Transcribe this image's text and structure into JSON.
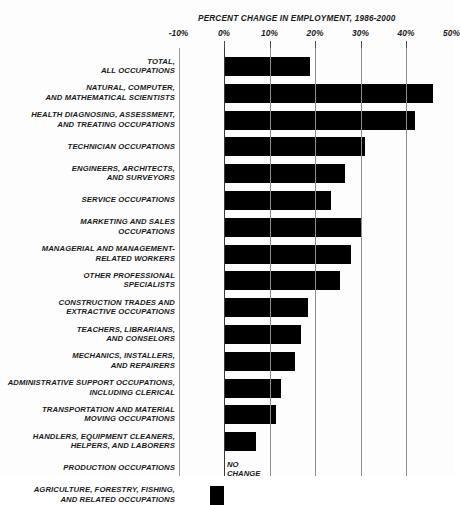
{
  "chart_data": {
    "type": "bar",
    "orientation": "horizontal",
    "title": "PERCENT CHANGE IN EMPLOYMENT, 1986-2000",
    "xlabel": "",
    "ylabel": "",
    "xlim": [
      -10,
      50
    ],
    "grid": true,
    "legend": null,
    "tick_labels": [
      "-10%",
      "0%",
      "10%",
      "20%",
      "30%",
      "40%",
      "50%"
    ],
    "tick_values": [
      -10,
      0,
      10,
      20,
      30,
      40,
      50
    ],
    "annotations": [
      {
        "text": "NO\nCHANGE",
        "category": "PRODUCTION OCCUPATIONS",
        "value": 0
      }
    ],
    "categories": [
      "TOTAL,\nALL OCCUPATIONS",
      "NATURAL, COMPUTER,\nAND MATHEMATICAL SCIENTISTS",
      "HEALTH DIAGNOSING, ASSESSMENT,\nAND TREATING OCCUPATIONS",
      "TECHNICIAN OCCUPATIONS",
      "ENGINEERS, ARCHITECTS,\nAND SURVEYORS",
      "SERVICE OCCUPATIONS",
      "MARKETING AND SALES\nOCCUPATIONS",
      "MANAGERIAL AND MANAGEMENT-\nRELATED WORKERS",
      "OTHER PROFESSIONAL\nSPECIALISTS",
      "CONSTRUCTION TRADES AND\nEXTRACTIVE OCCUPATIONS",
      "TEACHERS, LIBRARIANS,\nAND CONSELORS",
      "MECHANICS, INSTALLERS,\nAND REPAIRERS",
      "ADMINISTRATIVE SUPPORT OCCUPATIONS,\nINCLUDING CLERICAL",
      "TRANSPORTATION AND MATERIAL\nMOVING OCCUPATIONS",
      "HANDLERS, EQUIPMENT CLEANERS,\nHELPERS, AND LABORERS",
      "PRODUCTION OCCUPATIONS",
      "AGRICULTURE, FORESTRY, FISHING,\nAND RELATED OCCUPATIONS"
    ],
    "values": [
      19,
      46,
      42,
      31,
      26.5,
      23.5,
      30,
      28,
      25.5,
      18.5,
      17,
      15.5,
      12.5,
      11.5,
      7,
      0,
      -3
    ]
  }
}
